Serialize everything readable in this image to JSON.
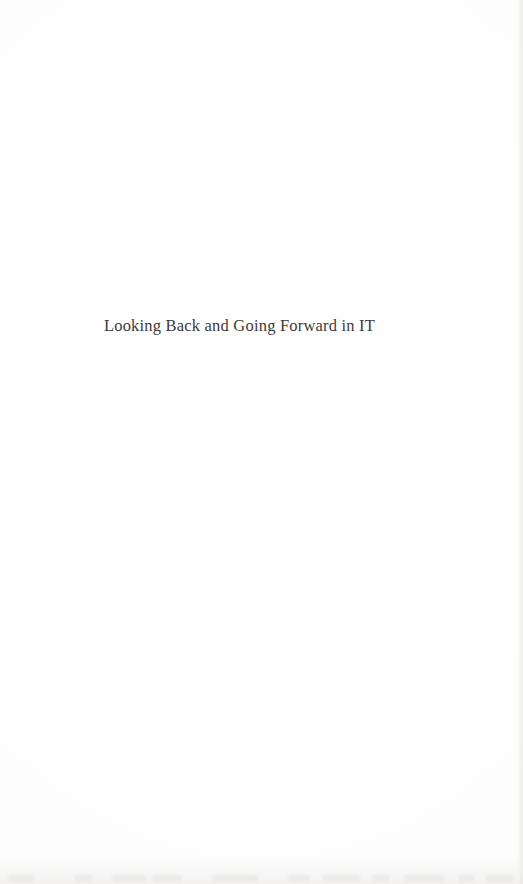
{
  "page": {
    "kind": "scanned-book-page",
    "background_color": "#fefefe",
    "width": 523,
    "height": 884
  },
  "content": {
    "title": "Looking Back and Going Forward in IT",
    "title_color": "#3b3b3b",
    "title_alignment": "center"
  },
  "artifacts": {
    "bleed_marks": [
      {
        "left": 8,
        "width": 26
      },
      {
        "left": 74,
        "width": 18
      },
      {
        "left": 112,
        "width": 34
      },
      {
        "left": 152,
        "width": 30
      },
      {
        "left": 212,
        "width": 46
      },
      {
        "left": 288,
        "width": 22
      },
      {
        "left": 322,
        "width": 38
      },
      {
        "left": 372,
        "width": 18
      },
      {
        "left": 404,
        "width": 40
      },
      {
        "left": 458,
        "width": 16
      },
      {
        "left": 486,
        "width": 28
      }
    ]
  }
}
